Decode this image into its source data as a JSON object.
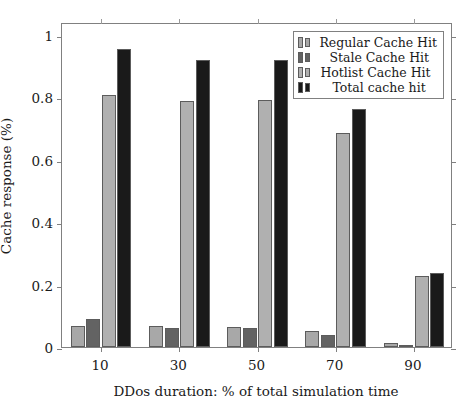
{
  "chart_data": {
    "type": "bar",
    "title": "",
    "subtitle": "",
    "xlabel": "DDos duration: % of total simulation time",
    "ylabel": "Cache response (%)",
    "categories": [
      "10",
      "30",
      "50",
      "70",
      "90"
    ],
    "xtick_labels": [
      "10",
      "30",
      "50",
      "70",
      "90"
    ],
    "ytick_labels": [
      "0",
      "0.2",
      "0.4",
      "0.6",
      "0.8",
      "1"
    ],
    "ytick_values": [
      0,
      0.2,
      0.4,
      0.6,
      0.8,
      1
    ],
    "ylim": [
      0,
      1.04
    ],
    "grid": false,
    "legend_position": "top-right-inside",
    "series": [
      {
        "name": "Regular Cache Hit",
        "color": "#a8a8a8",
        "values": [
          0.068,
          0.068,
          0.065,
          0.05,
          0.013
        ]
      },
      {
        "name": "Stale Cache Hit",
        "color": "#636363",
        "values": [
          0.09,
          0.062,
          0.062,
          0.04,
          0.005
        ]
      },
      {
        "name": "Hotlist Cache Hit",
        "color": "#b0b0b0",
        "values": [
          0.808,
          0.788,
          0.79,
          0.685,
          0.228
        ]
      },
      {
        "name": "Total cache hit",
        "color": "#1a1a1a",
        "values": [
          0.955,
          0.918,
          0.918,
          0.762,
          0.238
        ]
      }
    ]
  },
  "legend": {
    "entries": [
      {
        "label": "Regular Cache Hit"
      },
      {
        "label": "Stale Cache Hit"
      },
      {
        "label": "Hotlist Cache Hit"
      },
      {
        "label": "Total cache hit"
      }
    ]
  }
}
